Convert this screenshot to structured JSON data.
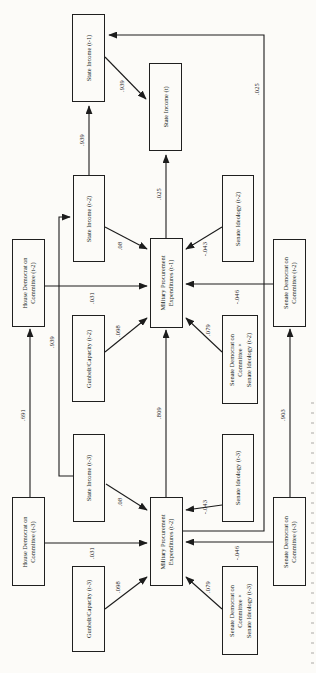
{
  "diagram": {
    "boxes": [
      {
        "id": "state-income-t1",
        "label": "State Income (t-1)"
      },
      {
        "id": "state-income-t",
        "label": "State Income (t)"
      },
      {
        "id": "state-income-t2",
        "label": "State Income (t-2)"
      },
      {
        "id": "senate-ideology-t2",
        "label": "Senate Ideology (t-2)"
      },
      {
        "id": "house-democrat-t2",
        "label": "House Democrat on\nCommittee (t-2)"
      },
      {
        "id": "mpe-t1",
        "label": "Military Procurement\nExpenditures (t-1)"
      },
      {
        "id": "senate-democrat-t2",
        "label": "Senate Democrat on\nCommittee (t-2)"
      },
      {
        "id": "gunbelt-t2",
        "label": "Gunbelt/Capacity (t-2)"
      },
      {
        "id": "senate-interaction-t2",
        "label": "Senate Democrat on\nCommittee ×\nSenate Ideology (t-2)"
      },
      {
        "id": "state-income-t3",
        "label": "State Income (t-3)"
      },
      {
        "id": "senate-ideology-t3",
        "label": "Senate Ideology (t-3)"
      },
      {
        "id": "house-democrat-t3",
        "label": "House Democrat on\nCommittee (t-3)"
      },
      {
        "id": "mpe-t2",
        "label": "Military Procurement\nExpenditures (t-2)"
      },
      {
        "id": "senate-democrat-t3",
        "label": "Senate Democrat on\nCommittee (t-3)"
      },
      {
        "id": "gunbelt-t3",
        "label": "Gunbelt/Capacity (t-3)"
      },
      {
        "id": "senate-interaction-t3",
        "label": "Senate Democrat on\nCommittee ×\nSenate Ideology (t-3)"
      }
    ],
    "coefficients": [
      {
        "path": "state-income-t2-to-state-income-t1",
        "value": ".939"
      },
      {
        "path": "state-income-t1-to-state-income-t",
        "value": ".939"
      },
      {
        "path": "mpe-t2-to-state-income-t1",
        "value": ".025"
      },
      {
        "path": "mpe-t1-to-state-income-t",
        "value": ".025"
      },
      {
        "path": "state-income-t2-to-mpe-t1",
        "value": ".08"
      },
      {
        "path": "senate-ideology-t2-to-mpe-t1",
        "value": "-.043"
      },
      {
        "path": "house-democrat-t2-to-mpe-t1",
        "value": ".031"
      },
      {
        "path": "senate-democrat-t2-to-mpe-t1",
        "value": "-.046"
      },
      {
        "path": "gunbelt-t2-to-mpe-t1",
        "value": ".098"
      },
      {
        "path": "senate-interaction-t2-to-mpe-t1",
        "value": ".079"
      },
      {
        "path": "mpe-t2-to-mpe-t1",
        "value": ".809"
      },
      {
        "path": "state-income-t3-to-state-income-t2",
        "value": ".939"
      },
      {
        "path": "state-income-t3-to-mpe-t2",
        "value": ".08"
      },
      {
        "path": "senate-ideology-t3-to-mpe-t2",
        "value": "-.043"
      },
      {
        "path": "house-democrat-t3-to-mpe-t2",
        "value": ".031"
      },
      {
        "path": "senate-democrat-t3-to-mpe-t2",
        "value": "-.046"
      },
      {
        "path": "gunbelt-t3-to-mpe-t2",
        "value": ".098"
      },
      {
        "path": "senate-interaction-t3-to-mpe-t2",
        "value": ".079"
      },
      {
        "path": "house-democrat-t3-to-house-democrat-t2",
        "value": ".691"
      },
      {
        "path": "senate-democrat-t3-to-senate-democrat-t2",
        "value": ".903"
      }
    ]
  }
}
